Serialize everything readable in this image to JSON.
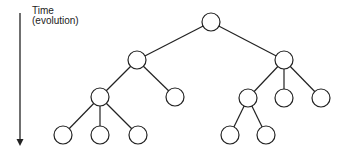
{
  "label": {
    "line1": "Time",
    "line2": "(evolution)"
  },
  "style": {
    "stroke": "#222222",
    "fill": "#ffffff",
    "node_radius": 9
  },
  "arrow": {
    "x": 20,
    "y1": 13,
    "y2": 146
  },
  "nodes": [
    {
      "id": "root",
      "x": 211,
      "y": 22
    },
    {
      "id": "a",
      "x": 137,
      "y": 60
    },
    {
      "id": "b",
      "x": 284,
      "y": 60
    },
    {
      "id": "a1",
      "x": 100,
      "y": 97
    },
    {
      "id": "a2",
      "x": 175,
      "y": 97
    },
    {
      "id": "b1",
      "x": 248,
      "y": 98
    },
    {
      "id": "b2",
      "x": 284,
      "y": 98
    },
    {
      "id": "b3",
      "x": 321,
      "y": 98
    },
    {
      "id": "a1x",
      "x": 63,
      "y": 135
    },
    {
      "id": "a1y",
      "x": 100,
      "y": 135
    },
    {
      "id": "a1z",
      "x": 138,
      "y": 135
    },
    {
      "id": "b1x",
      "x": 230,
      "y": 135
    },
    {
      "id": "b1y",
      "x": 266,
      "y": 135
    }
  ],
  "edges": [
    [
      "root",
      "a"
    ],
    [
      "root",
      "b"
    ],
    [
      "a",
      "a1"
    ],
    [
      "a",
      "a2"
    ],
    [
      "b",
      "b1"
    ],
    [
      "b",
      "b2"
    ],
    [
      "b",
      "b3"
    ],
    [
      "a1",
      "a1x"
    ],
    [
      "a1",
      "a1y"
    ],
    [
      "a1",
      "a1z"
    ],
    [
      "b1",
      "b1x"
    ],
    [
      "b1",
      "b1y"
    ]
  ]
}
